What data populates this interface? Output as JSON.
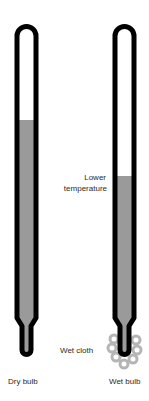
{
  "diagram": {
    "thermometers": [
      {
        "id": "dry",
        "label": "Dry bulb",
        "fill_top_y": 120
      },
      {
        "id": "wet",
        "label": "Wet bulb",
        "fill_top_y": 176
      }
    ],
    "annotations": {
      "lower_temperature_line1": "Lower",
      "lower_temperature_line2": "temperature",
      "wet_cloth": "Wet cloth"
    },
    "colors": {
      "outline": "#000000",
      "liquid": "#9a9a9a",
      "cloth": "#b5b5b5",
      "text": "#2a2a2a"
    }
  }
}
